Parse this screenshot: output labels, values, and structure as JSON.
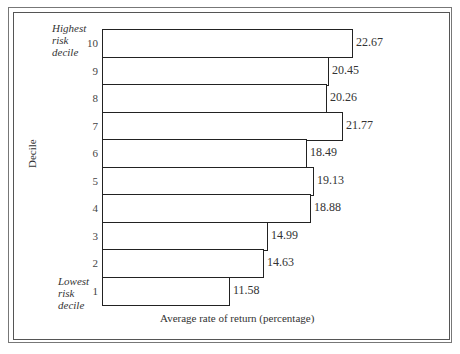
{
  "chart_data": {
    "type": "bar",
    "orientation": "horizontal",
    "title": "",
    "xlabel": "Average rate of return (percentage)",
    "ylabel": "Decile",
    "categories": [
      "10",
      "9",
      "8",
      "7",
      "6",
      "5",
      "4",
      "3",
      "2",
      "1"
    ],
    "values": [
      22.67,
      20.45,
      20.26,
      21.77,
      18.49,
      19.13,
      18.88,
      14.99,
      14.63,
      11.58
    ],
    "value_labels": [
      "22.67",
      "20.45",
      "20.26",
      "21.77",
      "18.49",
      "19.13",
      "18.88",
      "14.99",
      "14.63",
      "11.58"
    ],
    "annotations": {
      "top": "Highest risk decile",
      "bottom": "Lowest risk decile"
    },
    "grid": false,
    "legend": null,
    "bar_fill": "#ffffff",
    "bar_edge": "#222222"
  },
  "labels": {
    "xlabel": "Average rate of return (percentage)",
    "ylabel": "Decile",
    "top_annotation": [
      "Highest",
      "risk",
      "decile"
    ],
    "bottom_annotation": [
      "Lowest",
      "risk",
      "decile"
    ]
  }
}
